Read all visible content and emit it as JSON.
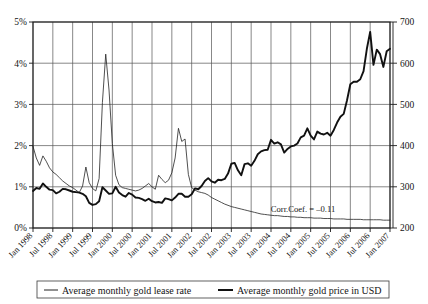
{
  "chart_data": {
    "type": "line",
    "title": "",
    "xlabel": "",
    "ylabel": "",
    "grid": true,
    "legend_position": "bottom",
    "annotations": [
      {
        "name": "correlation-coefficient",
        "text": "Corr.Coef. = –0.11",
        "x": "Jul 2005",
        "y": "230"
      }
    ],
    "x_axis": {
      "tick_labels": [
        "Jan 1998",
        "Jul 1998",
        "Jan 1999",
        "Jul 1999",
        "Jan 2000",
        "Jul 2000",
        "Jan 2001",
        "Jul 2001",
        "Jan 2002",
        "Jul 2002",
        "Jan 2003",
        "Jul 2003",
        "Jan 2004",
        "Jul 2004",
        "Jan 2005",
        "Jul 2005",
        "Jan 2006",
        "Jul 2006",
        "Jan 2007"
      ],
      "range": [
        "Jan 1998",
        "Jan 2007"
      ]
    },
    "y_axis_left": {
      "tick_labels": [
        "0%",
        "1%",
        "2%",
        "3%",
        "4%",
        "5%"
      ],
      "values": [
        0,
        1,
        2,
        3,
        4,
        5
      ],
      "ylim": [
        0,
        5
      ],
      "unit": "percent"
    },
    "y_axis_right": {
      "tick_labels": [
        "200",
        "300",
        "400",
        "500",
        "600",
        "700"
      ],
      "values": [
        200,
        300,
        400,
        500,
        600,
        700
      ],
      "ylim": [
        200,
        700
      ],
      "unit": "USD"
    },
    "series": [
      {
        "name": "Average monthly gold lease rate",
        "axis": "left",
        "unit": "percent",
        "style": "thin",
        "values": [
          1.98,
          1.7,
          1.52,
          1.75,
          1.62,
          1.46,
          1.36,
          1.3,
          1.22,
          1.14,
          1.08,
          1.02,
          0.98,
          0.92,
          0.86,
          1.02,
          1.48,
          1.1,
          0.96,
          0.9,
          1.2,
          3.05,
          4.22,
          3.35,
          2.05,
          1.28,
          1.05,
          0.98,
          0.96,
          0.94,
          0.92,
          0.9,
          0.92,
          0.96,
          1.02,
          1.08,
          1.0,
          0.94,
          1.28,
          1.18,
          1.1,
          1.16,
          1.34,
          1.7,
          2.42,
          2.1,
          2.16,
          1.3,
          0.98,
          0.92,
          0.88,
          0.86,
          0.84,
          0.8,
          0.74,
          0.7,
          0.66,
          0.62,
          0.58,
          0.55,
          0.52,
          0.5,
          0.48,
          0.46,
          0.44,
          0.42,
          0.4,
          0.38,
          0.36,
          0.34,
          0.33,
          0.32,
          0.31,
          0.3,
          0.3,
          0.29,
          0.28,
          0.28,
          0.27,
          0.27,
          0.26,
          0.26,
          0.25,
          0.25,
          0.25,
          0.24,
          0.24,
          0.24,
          0.23,
          0.23,
          0.23,
          0.22,
          0.22,
          0.22,
          0.22,
          0.21,
          0.21,
          0.21,
          0.21,
          0.21,
          0.2,
          0.2,
          0.2,
          0.2,
          0.2,
          0.2,
          0.19,
          0.19,
          0.19
        ]
      },
      {
        "name": "Average monthly gold price in USD",
        "axis": "right",
        "unit": "USD",
        "style": "thick",
        "values": [
          290,
          297,
          295,
          308,
          300,
          293,
          292,
          284,
          288,
          295,
          294,
          291,
          288,
          287,
          286,
          283,
          277,
          261,
          256,
          258,
          265,
          299,
          291,
          283,
          284,
          300,
          286,
          280,
          276,
          285,
          281,
          274,
          273,
          270,
          266,
          271,
          265,
          262,
          263,
          261,
          272,
          270,
          267,
          274,
          283,
          283,
          276,
          276,
          282,
          296,
          294,
          302,
          314,
          321,
          313,
          310,
          317,
          316,
          319,
          332,
          356,
          358,
          340,
          328,
          355,
          357,
          351,
          363,
          379,
          386,
          389,
          390,
          414,
          405,
          408,
          403,
          383,
          392,
          398,
          400,
          405,
          420,
          424,
          442,
          424,
          415,
          434,
          429,
          427,
          431,
          424,
          438,
          456,
          470,
          477,
          510,
          549,
          555,
          555,
          561,
          581,
          635,
          676,
          596,
          633,
          622,
          591,
          629,
          635
        ]
      }
    ]
  },
  "legend": {
    "entries": [
      {
        "label": "Average monthly gold lease rate",
        "style": "thin"
      },
      {
        "label": "Average monthly gold price in USD",
        "style": "thick"
      }
    ]
  }
}
